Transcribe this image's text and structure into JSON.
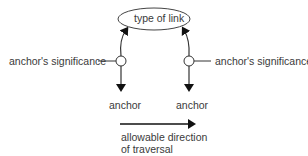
{
  "diagram": {
    "link_type_label": "type of link",
    "left_significance_label": "anchor's significance",
    "right_significance_label": "anchor's significance",
    "left_anchor_label": "anchor",
    "right_anchor_label": "anchor",
    "direction_label_line1": "allowable direction",
    "direction_label_line2": "of traversal"
  }
}
